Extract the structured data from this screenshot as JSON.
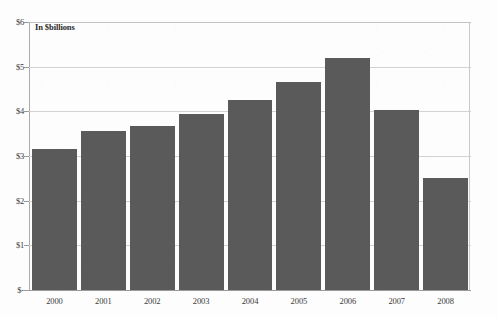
{
  "annotation": "In $billions",
  "scan_artifact": "",
  "colors": {
    "bar_fill": "#5a5a5a",
    "background": "#fdfdfd",
    "gridline": "#d2d2d2",
    "axis": "#9a9a9a",
    "text": "#3a3a3a"
  },
  "chart_data": {
    "type": "bar",
    "title": "",
    "subtitle": "",
    "xlabel": "",
    "ylabel": "In $billions",
    "categories": [
      "2000",
      "2001",
      "2002",
      "2003",
      "2004",
      "2005",
      "2006",
      "2007",
      "2008"
    ],
    "values": [
      3.15,
      3.55,
      3.67,
      3.93,
      4.25,
      4.65,
      5.2,
      4.02,
      2.5
    ],
    "ylim": [
      0,
      6
    ],
    "ytick_values": [
      0,
      1,
      2,
      3,
      4,
      5,
      6
    ],
    "ytick_labels": [
      "$-",
      "$1",
      "$2",
      "$3",
      "$4",
      "$5",
      "$6"
    ],
    "grid": true,
    "grid_axis": "y",
    "legend": false,
    "legend_position": "none",
    "annotations": [
      {
        "text": "In $billions",
        "position": "top-left-inside-plot"
      }
    ]
  }
}
